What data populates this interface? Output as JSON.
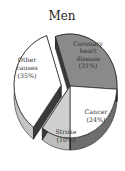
{
  "chart_data": {
    "type": "pie",
    "title": "Men",
    "style": "3d-exploded",
    "categories": [
      "Coronary heart disease",
      "Cancer",
      "Stroke",
      "Other causes"
    ],
    "values": [
      31,
      24,
      10,
      35
    ],
    "unit": "%",
    "slices": [
      {
        "name": "Coronary heart disease",
        "label_lines": [
          "Coronary",
          "heart",
          "disease",
          "(31%)"
        ],
        "value": 31,
        "color": "#8a8a8a",
        "side_color": "#3c3c3c",
        "exploded": false
      },
      {
        "name": "Cancer",
        "label_lines": [
          "Cancer",
          "(24%)"
        ],
        "value": 24,
        "color": "#ffffff",
        "side_color": "#6e6e6e",
        "exploded": false
      },
      {
        "name": "Stroke",
        "label_lines": [
          "Stroke",
          "(10%)"
        ],
        "value": 10,
        "color": "#cfcfcf",
        "side_color": "#bdbdbd",
        "exploded": false
      },
      {
        "name": "Other causes",
        "label_lines": [
          "Other",
          "causes",
          "(35%)"
        ],
        "value": 35,
        "color": "#ffffff",
        "side_color": "#c4c4c4",
        "exploded": true
      }
    ],
    "legend": "none"
  }
}
